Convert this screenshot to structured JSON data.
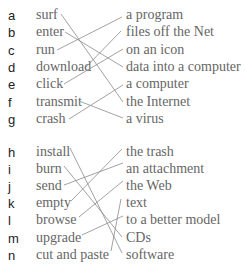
{
  "groups": [
    {
      "items": [
        {
          "letter": "a",
          "word": "surf"
        },
        {
          "letter": "b",
          "word": "enter"
        },
        {
          "letter": "c",
          "word": "run"
        },
        {
          "letter": "d",
          "word": "download"
        },
        {
          "letter": "e",
          "word": "click"
        },
        {
          "letter": "f",
          "word": "transmit"
        },
        {
          "letter": "g",
          "word": "crash"
        }
      ],
      "matches": [
        "a program",
        "files off the Net",
        "on an icon",
        "data into a computer",
        "a computer",
        "the Internet",
        "a virus"
      ]
    },
    {
      "items": [
        {
          "letter": "h",
          "word": "install"
        },
        {
          "letter": "i",
          "word": "burn"
        },
        {
          "letter": "j",
          "word": "send"
        },
        {
          "letter": "k",
          "word": "empty"
        },
        {
          "letter": "l",
          "word": "browse"
        },
        {
          "letter": "m",
          "word": "upgrade"
        },
        {
          "letter": "n",
          "word": "cut and paste"
        }
      ],
      "matches": [
        "the trash",
        "an attachment",
        "the Web",
        "text",
        "to a better model",
        "CDs",
        "software"
      ]
    }
  ]
}
